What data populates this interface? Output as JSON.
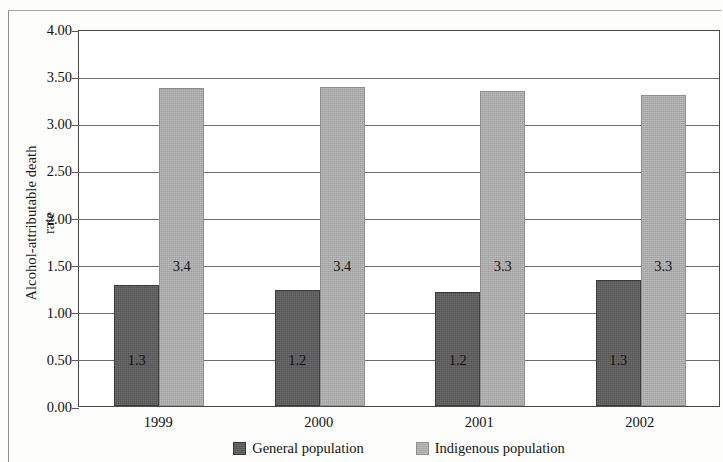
{
  "chart_data": {
    "type": "bar",
    "title": "",
    "subtitle": "",
    "xlabel": "",
    "ylabel_line1": "Alcohol-attributable death",
    "ylabel_line2": "rate",
    "categories": [
      "1999",
      "2000",
      "2001",
      "2002"
    ],
    "series": [
      {
        "name": "General population",
        "color": "#5c5c5c",
        "values": [
          1.28,
          1.23,
          1.21,
          1.34
        ],
        "labels": [
          "1.3",
          "1.2",
          "1.2",
          "1.3"
        ]
      },
      {
        "name": "Indigenous population",
        "color": "#aeaeae",
        "values": [
          3.37,
          3.38,
          3.34,
          3.3
        ],
        "labels": [
          "3.4",
          "3.4",
          "3.3",
          "3.3"
        ]
      }
    ],
    "ylim": [
      0,
      4.0
    ],
    "ytick_step": 0.5,
    "ytick_labels": [
      "0.00",
      "0.50",
      "1.00",
      "1.50",
      "2.00",
      "2.50",
      "3.00",
      "3.50",
      "4.00"
    ],
    "ytick_values": [
      0,
      0.5,
      1,
      1.5,
      2,
      2.5,
      3,
      3.5,
      4
    ],
    "grid": true,
    "grid_axis": "y",
    "legend_position": "bottom",
    "legend_entries": [
      "General population",
      "Indigenous population"
    ]
  }
}
